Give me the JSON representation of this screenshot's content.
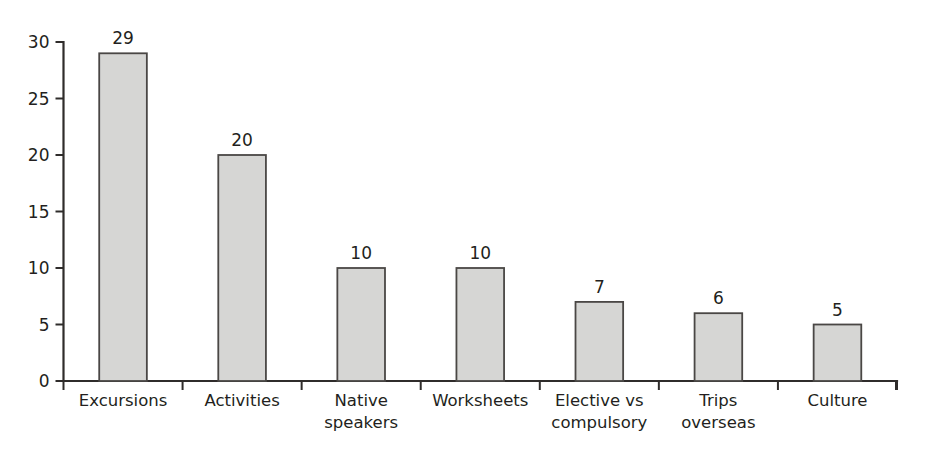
{
  "chart_data": {
    "type": "bar",
    "title": "",
    "subtitle": "",
    "xlabel": "",
    "ylabel": "",
    "categories": [
      "Excursions",
      "Activities",
      "Native speakers",
      "Worksheets",
      "Elective vs compulsory",
      "Trips overseas",
      "Culture"
    ],
    "category_lines": [
      [
        "Excursions"
      ],
      [
        "Activities"
      ],
      [
        "Native",
        "speakers"
      ],
      [
        "Worksheets"
      ],
      [
        "Elective vs",
        "compulsory"
      ],
      [
        "Trips",
        "overseas"
      ],
      [
        "Culture"
      ]
    ],
    "values": [
      29,
      20,
      10,
      10,
      7,
      6,
      5
    ],
    "value_labels": [
      "29",
      "20",
      "10",
      "10",
      "7",
      "6",
      "5"
    ],
    "ylim": [
      0,
      30
    ],
    "ytick_values": [
      0,
      5,
      10,
      15,
      20,
      25,
      30
    ],
    "ytick_labels": [
      "0",
      "5",
      "10",
      "15",
      "20",
      "25",
      "30"
    ],
    "grid": false,
    "legend": false,
    "legend_position": "none",
    "bar_fill_color": "#d6d6d4",
    "bar_border_color": "#4a4745",
    "axis_color": "#2f2c2b",
    "background_color": "#ffffff"
  }
}
